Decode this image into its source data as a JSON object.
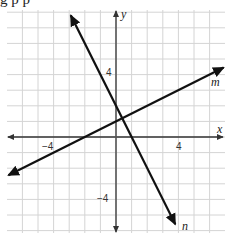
{
  "header_fragment": "g p    p",
  "chart_data": {
    "type": "line",
    "title": "",
    "xlabel": "x",
    "ylabel": "y",
    "xlim": [
      -7,
      7
    ],
    "ylim": [
      -6.2,
      8
    ],
    "grid": true,
    "x_ticks_labeled": [
      {
        "value": -4,
        "label": "−4"
      },
      {
        "value": 4,
        "label": "4"
      }
    ],
    "y_ticks_labeled": [
      {
        "value": 4,
        "label": "4"
      },
      {
        "value": -4,
        "label": "−4"
      }
    ],
    "series": [
      {
        "name": "m",
        "equation": "y = 0.5x + 1",
        "slope": 0.5,
        "intercept": 1,
        "x": [
          -6.9,
          6.9
        ],
        "y": [
          -2.45,
          4.45
        ],
        "arrows": "both"
      },
      {
        "name": "n",
        "equation": "y = -2x + 2",
        "slope": -2,
        "intercept": 2,
        "x": [
          -2.9,
          3.8
        ],
        "y": [
          7.8,
          -5.6
        ],
        "arrows": "both"
      }
    ],
    "intersection": {
      "x": 0.4,
      "y": 1.2
    },
    "legend": "inline labels (m at right end, n at bottom end)"
  },
  "labels": {
    "x_axis": "x",
    "y_axis": "y",
    "x_neg4": "−4",
    "x_pos4": "4",
    "y_pos4": "4",
    "y_neg4": "−4",
    "line_m": "m",
    "line_n": "n"
  }
}
